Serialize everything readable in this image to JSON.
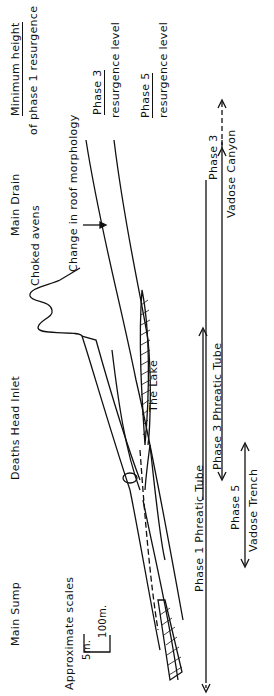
{
  "diagram": {
    "type": "cave longitudinal profile (rotated 90°)",
    "orientation": "text reads bottom-to-top",
    "colors": {
      "line": "#111111",
      "background": "#ffffff"
    }
  },
  "locations": {
    "main_sump": "Main Sump",
    "deaths_head_inlet": "Deaths Head Inlet",
    "main_drain": "Main Drain",
    "choked_avens": "Choked avens",
    "the_lake": "The Lake",
    "change_roof": "Change in roof morphology"
  },
  "levels": {
    "min_height_line1": "Minimum height",
    "min_height_line2": "of phase 1 resurgence",
    "phase3_line1": "Phase 3",
    "phase3_line2": "resurgence level",
    "phase5_line1": "Phase 5",
    "phase5_line2": "resurgence level"
  },
  "scale": {
    "title": "Approximate scales",
    "vertical": "5m.",
    "horizontal": "100m."
  },
  "phases": {
    "p1": "Phase 1   Phreatic   Tube",
    "p3_tube": "Phase  3   Phreatic  Tube",
    "p3_canyon_1": "Phase  3",
    "p3_canyon_2": "Vadose  Canyon",
    "p5_1": "Phase  5",
    "p5_2": "Vadose Trench"
  }
}
